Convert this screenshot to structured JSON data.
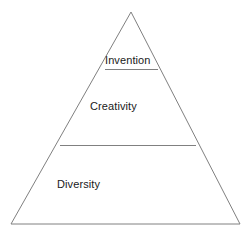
{
  "diagram": {
    "type": "pyramid",
    "title": "",
    "background_color": "#ffffff",
    "stroke_color": "#808080",
    "stroke_width": 1,
    "text_color": "#1a1a1a",
    "geometry": {
      "canvas_width": 251,
      "canvas_height": 239,
      "apex": {
        "x": 131,
        "y": 12
      },
      "base_left": {
        "x": 11,
        "y": 224
      },
      "base_right": {
        "x": 240,
        "y": 224
      },
      "dividers": [
        {
          "y": 69,
          "x_left": 105,
          "x_right": 158
        },
        {
          "y": 145,
          "x_left": 60,
          "x_right": 196
        }
      ]
    },
    "tiers": [
      {
        "level": 1,
        "position": "top",
        "label": "Invention"
      },
      {
        "level": 2,
        "position": "middle",
        "label": "Creativity"
      },
      {
        "level": 3,
        "position": "bottom",
        "label": "Diversity"
      }
    ]
  }
}
